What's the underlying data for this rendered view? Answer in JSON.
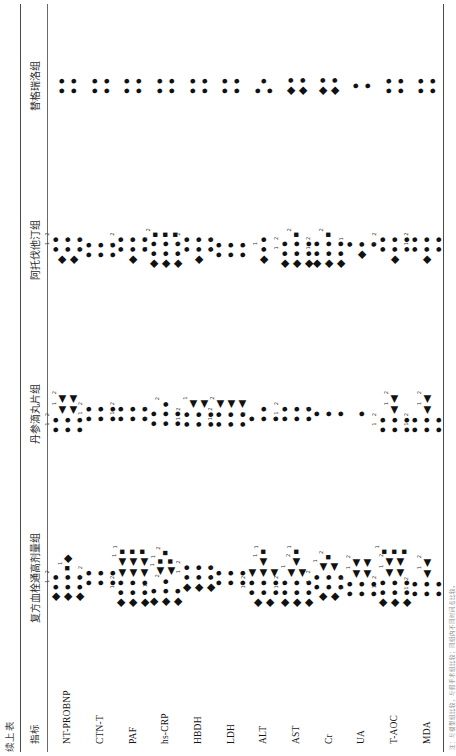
{
  "caption": "续上表",
  "footnote": "注：与模型组比较，与假手术组比较；同组内不同时间点比较。",
  "header": {
    "indicator_label": "指标",
    "groups": [
      "复方血栓通高剂量组",
      "丹参滴丸片组",
      "阿托伐他汀组",
      "替格瑞洛组"
    ]
  },
  "indicators": [
    "NT-PROBNP",
    "CTN-T",
    "PAF",
    "hs-CRP",
    "HBDH",
    "LDH",
    "ALT",
    "AST",
    "Cr",
    "UA",
    "T-AOC",
    "MDA"
  ],
  "symbols": {
    "circle": "●",
    "diamond": "◆",
    "square": "■",
    "triangle": "◀"
  },
  "chart_data": {
    "type": "table",
    "title": "续上表",
    "row_header": "指标",
    "categories": [
      "NT-PROBNP",
      "CTN-T",
      "PAF",
      "hs-CRP",
      "HBDH",
      "LDH",
      "ALT",
      "AST",
      "Cr",
      "UA",
      "T-AOC",
      "MDA"
    ],
    "columns": [
      "复方血栓通高剂量组",
      "丹参滴丸片组",
      "阿托伐他汀组",
      "替格瑞洛组"
    ],
    "legend": [
      {
        "glyph": "●",
        "name": "circle-marker"
      },
      {
        "glyph": "◆",
        "name": "diamond-marker"
      },
      {
        "glyph": "■",
        "name": "square-marker"
      },
      {
        "glyph": "◀",
        "name": "triangle-marker"
      }
    ],
    "cells": [
      [
        [
          {
            "s": "diamond",
            "n": 3
          },
          {
            "s": "circle",
            "n": 3,
            "sup": "1"
          },
          {
            "s": "circle",
            "n": 3,
            "sup": "2"
          },
          {
            "s": "square",
            "n": 1,
            "sup": "1"
          },
          {
            "s": "diamond",
            "n": 1
          }
        ],
        [
          {
            "s": "circle",
            "n": 3,
            "sup": "1"
          },
          {
            "s": "circle",
            "n": 3,
            "sup": "2"
          },
          {
            "s": "triangle",
            "n": 2,
            "sup": "1"
          },
          {
            "s": "triangle",
            "n": 2,
            "sup": "2"
          }
        ],
        [
          {
            "s": "diamond",
            "n": 2
          },
          {
            "s": "circle",
            "n": 3,
            "sup": "1"
          },
          {
            "s": "circle",
            "n": 3,
            "sup": "2"
          }
        ],
        [
          {
            "s": "circle",
            "n": 2
          },
          {
            "s": "circle",
            "n": 2
          }
        ]
      ],
      [
        [
          {
            "s": "circle",
            "n": 3,
            "sup": "1"
          },
          {
            "s": "circle",
            "n": 3,
            "sup": "2"
          }
        ],
        [
          {
            "s": "circle",
            "n": 3,
            "sup": "1"
          },
          {
            "s": "circle",
            "n": 3,
            "sup": "2"
          }
        ],
        [
          {
            "s": "circle",
            "n": 3,
            "sup": "1"
          },
          {
            "s": "circle",
            "n": 3,
            "sup": "2"
          }
        ],
        [
          {
            "s": "circle",
            "n": 2
          },
          {
            "s": "circle",
            "n": 2
          }
        ]
      ],
      [
        [
          {
            "s": "diamond",
            "n": 3
          },
          {
            "s": "circle",
            "n": 3,
            "sup": "1"
          },
          {
            "s": "circle",
            "n": 3,
            "sup": "2"
          },
          {
            "s": "triangle",
            "n": 3
          },
          {
            "s": "triangle",
            "n": 3,
            "sup": "1"
          },
          {
            "s": "square",
            "n": 3,
            "sup": "1"
          }
        ],
        [
          {
            "s": "circle",
            "n": 3,
            "sup": "1"
          },
          {
            "s": "circle",
            "n": 3,
            "sup": "2"
          }
        ],
        [
          {
            "s": "diamond",
            "n": 1
          },
          {
            "s": "circle",
            "n": 3,
            "sup": "1"
          },
          {
            "s": "circle",
            "n": 3,
            "sup": "2"
          }
        ],
        [
          {
            "s": "circle",
            "n": 2
          },
          {
            "s": "circle",
            "n": 2
          }
        ]
      ],
      [
        [
          {
            "s": "diamond",
            "n": 3
          },
          {
            "s": "circle",
            "n": 3,
            "sup": "1"
          },
          {
            "s": "circle",
            "n": 1,
            "sup": "2"
          },
          {
            "s": "triangle",
            "n": 2,
            "sup": "1"
          },
          {
            "s": "square",
            "n": 2,
            "sup": "1"
          },
          {
            "s": "square",
            "n": 1,
            "sup": "2"
          }
        ],
        [
          {
            "s": "circle",
            "n": 3,
            "sup": "1"
          },
          {
            "s": "circle",
            "n": 3,
            "sup": "2"
          },
          {
            "s": "circle",
            "n": 1,
            "sup": "2"
          }
        ],
        [
          {
            "s": "diamond",
            "n": 3
          },
          {
            "s": "circle",
            "n": 3,
            "sup": "1"
          },
          {
            "s": "circle",
            "n": 3,
            "sup": "2"
          },
          {
            "s": "square",
            "n": 3,
            "sup": "2"
          }
        ],
        [
          {
            "s": "circle",
            "n": 2
          },
          {
            "s": "circle",
            "n": 2
          }
        ]
      ],
      [
        [
          {
            "s": "diamond",
            "n": 3
          },
          {
            "s": "circle",
            "n": 3,
            "sup": "1"
          },
          {
            "s": "circle",
            "n": 3,
            "sup": "2"
          }
        ],
        [
          {
            "s": "circle",
            "n": 3,
            "sup": "1"
          },
          {
            "s": "circle",
            "n": 3,
            "sup": "2"
          },
          {
            "s": "triangle",
            "n": 2,
            "sup": "1"
          }
        ],
        [
          {
            "s": "diamond",
            "n": 1
          },
          {
            "s": "circle",
            "n": 3,
            "sup": "1"
          },
          {
            "s": "circle",
            "n": 3,
            "sup": "2"
          }
        ],
        [
          {
            "s": "circle",
            "n": 2
          },
          {
            "s": "circle",
            "n": 2
          }
        ]
      ],
      [
        [
          {
            "s": "circle",
            "n": 3,
            "sup": "1"
          },
          {
            "s": "circle",
            "n": 3,
            "sup": "2"
          }
        ],
        [
          {
            "s": "circle",
            "n": 3,
            "sup": "1"
          },
          {
            "s": "circle",
            "n": 3,
            "sup": "2"
          },
          {
            "s": "triangle",
            "n": 3,
            "sup": "2"
          }
        ],
        [
          {
            "s": "circle",
            "n": 3,
            "sup": "1"
          },
          {
            "s": "circle",
            "n": 3,
            "sup": "2"
          }
        ],
        [
          {
            "s": "circle",
            "n": 2
          },
          {
            "s": "circle",
            "n": 2
          }
        ]
      ],
      [
        [
          {
            "s": "diamond",
            "n": 2
          },
          {
            "s": "circle",
            "n": 3,
            "sup": "1"
          },
          {
            "s": "circle",
            "n": 3,
            "sup": "2"
          },
          {
            "s": "triangle",
            "n": 3
          },
          {
            "s": "triangle",
            "n": 1,
            "sup": "1"
          },
          {
            "s": "square",
            "n": 1,
            "sup": "1"
          }
        ],
        [
          {
            "s": "circle",
            "n": 3,
            "sup": "2"
          },
          {
            "s": "circle",
            "n": 1
          }
        ],
        [
          {
            "s": "diamond",
            "n": 1
          },
          {
            "s": "circle",
            "n": 1,
            "sup": "1"
          },
          {
            "s": "circle",
            "n": 1
          }
        ],
        [
          {
            "s": "circle",
            "n": 2
          },
          {
            "s": "circle",
            "n": 1
          }
        ]
      ],
      [
        [
          {
            "s": "diamond",
            "n": 3
          },
          {
            "s": "circle",
            "n": 3,
            "sup": "1"
          },
          {
            "s": "circle",
            "n": 3,
            "sup": "2"
          },
          {
            "s": "triangle",
            "n": 2,
            "sup": "1"
          },
          {
            "s": "triangle",
            "n": 1,
            "sup": "2"
          },
          {
            "s": "square",
            "n": 1,
            "sup": "1"
          }
        ],
        [
          {
            "s": "circle",
            "n": 3,
            "sup": "1"
          },
          {
            "s": "circle",
            "n": 3,
            "sup": "2"
          }
        ],
        [
          {
            "s": "diamond",
            "n": 3
          },
          {
            "s": "circle",
            "n": 3,
            "sup": "1"
          },
          {
            "s": "circle",
            "n": 3,
            "sup": "2"
          },
          {
            "s": "square",
            "n": 1,
            "sup": "2"
          }
        ],
        [
          {
            "s": "diamond",
            "n": 2
          },
          {
            "s": "circle",
            "n": 2
          }
        ]
      ],
      [
        [
          {
            "s": "diamond",
            "n": 2
          },
          {
            "s": "circle",
            "n": 3,
            "sup": "1"
          },
          {
            "s": "circle",
            "n": 3,
            "sup": "2"
          },
          {
            "s": "triangle",
            "n": 2,
            "sup": "1"
          },
          {
            "s": "square",
            "n": 1,
            "sup": "2"
          }
        ],
        [
          {
            "s": "circle",
            "n": 3,
            "sup": "2"
          }
        ],
        [
          {
            "s": "diamond",
            "n": 3
          },
          {
            "s": "circle",
            "n": 3,
            "sup": "1"
          },
          {
            "s": "circle",
            "n": 3,
            "sup": "2"
          },
          {
            "s": "square",
            "n": 1,
            "sup": "2"
          }
        ],
        [
          {
            "s": "diamond",
            "n": 2
          },
          {
            "s": "circle",
            "n": 2
          }
        ]
      ],
      [
        [
          {
            "s": "circle",
            "n": 3,
            "sup": "1"
          },
          {
            "s": "circle",
            "n": 3,
            "sup": "2"
          },
          {
            "s": "triangle",
            "n": 2,
            "sup": "1"
          },
          {
            "s": "triangle",
            "n": 2,
            "sup": "2"
          }
        ],
        [
          {
            "s": "circle",
            "n": 1
          }
        ],
        [
          {
            "s": "diamond",
            "n": 1
          },
          {
            "s": "circle",
            "n": 3,
            "sup": "1"
          }
        ],
        [
          {
            "s": "circle",
            "n": 2
          }
        ]
      ],
      [
        [
          {
            "s": "diamond",
            "n": 3
          },
          {
            "s": "circle",
            "n": 3,
            "sup": "1"
          },
          {
            "s": "circle",
            "n": 3,
            "sup": "2"
          },
          {
            "s": "triangle",
            "n": 2,
            "sup": "1"
          },
          {
            "s": "triangle",
            "n": 2,
            "sup": "2"
          },
          {
            "s": "square",
            "n": 3,
            "sup": "1"
          }
        ],
        [
          {
            "s": "circle",
            "n": 3,
            "sup": "1"
          },
          {
            "s": "circle",
            "n": 3,
            "sup": "2"
          },
          {
            "s": "triangle",
            "n": 1,
            "sup": "1"
          },
          {
            "s": "triangle",
            "n": 1,
            "sup": "2"
          }
        ],
        [
          {
            "s": "diamond",
            "n": 1
          },
          {
            "s": "circle",
            "n": 3,
            "sup": "1"
          },
          {
            "s": "circle",
            "n": 3,
            "sup": "2"
          }
        ],
        [
          {
            "s": "circle",
            "n": 2
          },
          {
            "s": "circle",
            "n": 2
          }
        ]
      ],
      [
        [
          {
            "s": "circle",
            "n": 3,
            "sup": "1"
          },
          {
            "s": "circle",
            "n": 3,
            "sup": "2"
          },
          {
            "s": "triangle",
            "n": 1,
            "sup": "1"
          },
          {
            "s": "triangle",
            "n": 1,
            "sup": "2"
          }
        ],
        [
          {
            "s": "circle",
            "n": 3,
            "sup": "1"
          },
          {
            "s": "circle",
            "n": 3,
            "sup": "2"
          },
          {
            "s": "triangle",
            "n": 1,
            "sup": "1"
          },
          {
            "s": "triangle",
            "n": 1,
            "sup": "2"
          }
        ],
        [
          {
            "s": "diamond",
            "n": 1
          },
          {
            "s": "circle",
            "n": 3,
            "sup": "1"
          },
          {
            "s": "circle",
            "n": 3,
            "sup": "2"
          }
        ],
        [
          {
            "s": "circle",
            "n": 2
          },
          {
            "s": "circle",
            "n": 2
          }
        ]
      ]
    ]
  }
}
